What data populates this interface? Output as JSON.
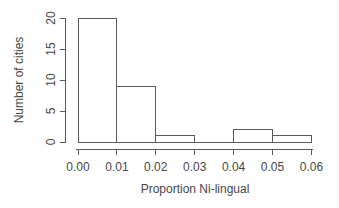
{
  "figure": {
    "background": "#ffffff"
  },
  "chart_data": {
    "type": "bar",
    "subtype": "histogram",
    "title": "",
    "xlabel": "Proportion Ni-lingual",
    "ylabel": "Number of cities",
    "bin_edges": [
      0.0,
      0.01,
      0.02,
      0.03,
      0.04,
      0.05,
      0.06
    ],
    "counts": [
      20,
      9,
      1,
      0,
      2,
      1
    ],
    "x_tick_labels": [
      "0.00",
      "0.01",
      "0.02",
      "0.03",
      "0.04",
      "0.05",
      "0.06"
    ],
    "y_tick_values": [
      0,
      5,
      10,
      15,
      20
    ],
    "y_tick_labels": [
      "0",
      "5",
      "10",
      "15",
      "20"
    ],
    "xlim": [
      0.0,
      0.06
    ],
    "ylim": [
      0,
      20
    ],
    "grid": false,
    "legend": "none",
    "y_tick_label_rotation": -90,
    "bar_fill": "#ffffff",
    "line_color": "#5a5a5a",
    "text_color": "#474747"
  }
}
